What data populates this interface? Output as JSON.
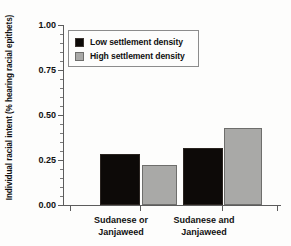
{
  "chart_data": {
    "type": "bar",
    "title": "",
    "xlabel": "",
    "ylabel": "Individual racial intent (% hearing racial epithets)",
    "ylim": [
      0.0,
      1.0
    ],
    "ytick_labels": [
      "0.00",
      "0.25",
      "0.50",
      "0.75",
      "1.00"
    ],
    "ytick_values": [
      0.0,
      0.25,
      0.5,
      0.75,
      1.0
    ],
    "grid": false,
    "legend_position": "upper left",
    "categories": [
      "Sudanese or Janjaweed",
      "Sudanese and Janjaweed"
    ],
    "category_lines": [
      [
        "Sudanese or",
        "Janjaweed"
      ],
      [
        "Sudanese and",
        "Janjaweed"
      ]
    ],
    "series": [
      {
        "name": "Low settlement density",
        "color": "#0d0a08",
        "values": [
          0.285,
          0.315
        ]
      },
      {
        "name": "High settlement density",
        "color": "#a9a9a7",
        "values": [
          0.225,
          0.43
        ]
      }
    ]
  },
  "legend": {
    "items": [
      {
        "label": "Low settlement density",
        "swatch": "black"
      },
      {
        "label": "High settlement density",
        "swatch": "gray"
      }
    ]
  },
  "axis": {
    "y_label": "Individual racial intent (% hearing racial epithets)",
    "ticks": [
      {
        "label": "1.00"
      },
      {
        "label": "0.75"
      },
      {
        "label": "0.50"
      },
      {
        "label": "0.25"
      },
      {
        "label": "0.00"
      }
    ]
  },
  "xcategories": [
    {
      "line1": "Sudanese or",
      "line2": "Janjaweed"
    },
    {
      "line1": "Sudanese and",
      "line2": "Janjaweed"
    }
  ],
  "colors": {
    "black_series": "#0d0a08",
    "gray_series": "#a9a9a7",
    "axis": "#5c5c5c",
    "background": "#fdfdfc"
  }
}
